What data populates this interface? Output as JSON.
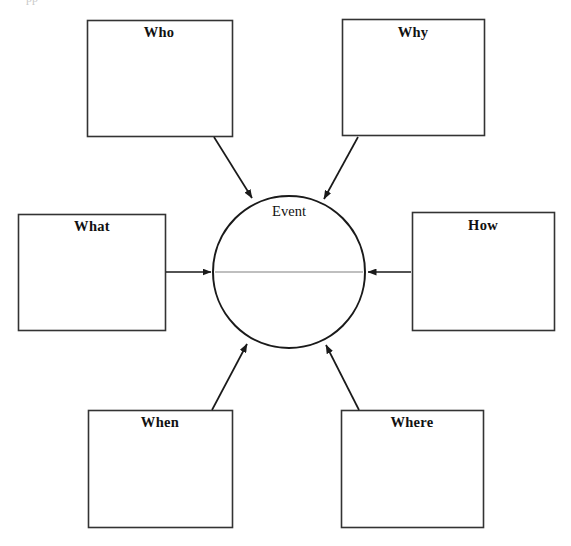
{
  "page": {
    "width": 571,
    "height": 546,
    "background_color": "#ffffff",
    "top_text_fragment": "pp"
  },
  "colors": {
    "stroke": "#1a1a1a",
    "box_stroke": "#333333",
    "divider_line": "#808080",
    "text": "#111111",
    "background": "#ffffff"
  },
  "center": {
    "label": "Event",
    "shape": "circle",
    "cx": 289,
    "cy": 272,
    "r": 76,
    "label_x": 289,
    "label_y": 203,
    "has_divider_line": true,
    "divider_y": 272
  },
  "boxes": [
    {
      "id": "who",
      "label": "Who",
      "x": 87,
      "y": 20,
      "width": 145,
      "height": 116,
      "label_x": 159,
      "label_y": 24,
      "position": "top-left"
    },
    {
      "id": "why",
      "label": "Why",
      "x": 342,
      "y": 19,
      "width": 142,
      "height": 116,
      "label_x": 413,
      "label_y": 24,
      "position": "top-right"
    },
    {
      "id": "what",
      "label": "What",
      "x": 18,
      "y": 214,
      "width": 147,
      "height": 116,
      "label_x": 92,
      "label_y": 218,
      "position": "left"
    },
    {
      "id": "how",
      "label": "How",
      "x": 412,
      "y": 212,
      "width": 142,
      "height": 118,
      "label_x": 483,
      "label_y": 217,
      "position": "right"
    },
    {
      "id": "when",
      "label": "When",
      "x": 88,
      "y": 410,
      "width": 144,
      "height": 117,
      "label_x": 160,
      "label_y": 414,
      "position": "bottom-left"
    },
    {
      "id": "where",
      "label": "Where",
      "x": 341,
      "y": 410,
      "width": 142,
      "height": 117,
      "label_x": 412,
      "label_y": 414,
      "position": "bottom-right"
    }
  ],
  "arrows": [
    {
      "id": "who-to-event",
      "from": "who",
      "to": "event",
      "x1": 214,
      "y1": 137,
      "x2": 252,
      "y2": 198
    },
    {
      "id": "why-to-event",
      "from": "why",
      "to": "event",
      "x1": 358,
      "y1": 137,
      "x2": 324,
      "y2": 199
    },
    {
      "id": "what-to-event",
      "from": "what",
      "to": "event",
      "x1": 166,
      "y1": 272,
      "x2": 211,
      "y2": 272
    },
    {
      "id": "how-to-event",
      "from": "how",
      "to": "event",
      "x1": 411,
      "y1": 272,
      "x2": 368,
      "y2": 272
    },
    {
      "id": "when-to-event",
      "from": "when",
      "to": "event",
      "x1": 212,
      "y1": 410,
      "x2": 247,
      "y2": 344
    },
    {
      "id": "where-to-event",
      "from": "where",
      "to": "event",
      "x1": 359,
      "y1": 410,
      "x2": 326,
      "y2": 345
    }
  ]
}
